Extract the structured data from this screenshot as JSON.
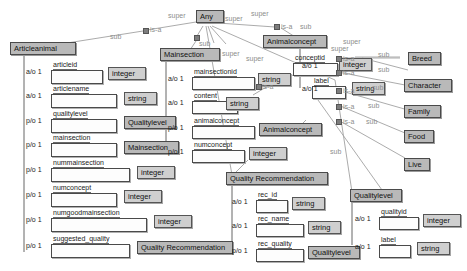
{
  "diagram": {
    "root": "Any",
    "edge_labels": {
      "super": "super",
      "sub": "sub",
      "isa": "is-a"
    },
    "colors": {
      "class_fill": "#b9b9b9",
      "type_fill": "#cfcfcf",
      "slot_fill": "#fdfdfd",
      "edge": "#9a9a9a",
      "text": "#111111",
      "edge_label": "#8d8d8d"
    }
  },
  "classes": {
    "any": {
      "label": "Any"
    },
    "articleanimal": {
      "label": "Articleanimal"
    },
    "mainsection": {
      "label": "Mainsection"
    },
    "animalconcept": {
      "label": "Animalconcept"
    },
    "quality_recommendation": {
      "label": "Quality Recommendation"
    },
    "qualitylevel": {
      "label": "Qualitylevel"
    },
    "breed": {
      "label": "Breed"
    },
    "character": {
      "label": "Character"
    },
    "family": {
      "label": "Family"
    },
    "food": {
      "label": "Food"
    },
    "live": {
      "label": "Live"
    }
  },
  "cardinalities": {
    "ao": "a/o 1",
    "po": "p/o 1"
  },
  "types": {
    "integer": "integer",
    "string": "string",
    "qualitylevel": "Qualitylevel",
    "mainsection": "Mainsection",
    "animalconcept": "Animalconcept",
    "quality_recommendation": "Quality Recommendation"
  },
  "articleanimal_attrs": [
    {
      "card": "a/o 1",
      "name": "articleid",
      "type": "integer"
    },
    {
      "card": "a/o 1",
      "name": "articlename",
      "type": "string"
    },
    {
      "card": "p/o 1",
      "name": "qualitylevel",
      "type": "Qualitylevel"
    },
    {
      "card": "p/o 1",
      "name": "mainsection",
      "type": "Mainsection"
    },
    {
      "card": "p/o 1",
      "name": "nummainsection",
      "type": "integer"
    },
    {
      "card": "p/o 1",
      "name": "numconcept",
      "type": "integer"
    },
    {
      "card": "p/o 1",
      "name": "numgoodmainsection",
      "type": "integer"
    },
    {
      "card": "p/o 1",
      "name": "suggested_quality",
      "type": "Quality Recommendation"
    }
  ],
  "mainsection_attrs": [
    {
      "card": "a/o 1",
      "name": "mainsectionid",
      "type": "string"
    },
    {
      "card": "a/o 1",
      "name": "content",
      "type": "string"
    },
    {
      "card": "p/o 1",
      "name": "animalconcept",
      "type": "Animalconcept"
    },
    {
      "card": "p/o 1",
      "name": "numconcept",
      "type": "integer"
    }
  ],
  "animalconcept_attrs": [
    {
      "card": "a/o 1",
      "name": "conceptid",
      "type": "integer"
    },
    {
      "card": "a/o 1",
      "name": "label",
      "type": "string"
    }
  ],
  "quality_recommendation_attrs": [
    {
      "card": "a/o 1",
      "name": "rec_id",
      "type": "string"
    },
    {
      "card": "a/o 1",
      "name": "rec_name",
      "type": "string"
    },
    {
      "card": "p/o 1",
      "name": "rec_quality",
      "type": "Qualitylevel"
    }
  ],
  "qualitylevel_attrs": [
    {
      "card": "a/o 1",
      "name": "qualityid",
      "type": "integer"
    },
    {
      "card": "a/o 1",
      "name": "label",
      "type": "string"
    }
  ],
  "subclasses_of_any": [
    "Articleanimal",
    "Mainsection",
    "Animalconcept",
    "Quality Recommendation",
    "Qualitylevel"
  ],
  "subclasses_of_animalconcept": [
    "Breed",
    "Character",
    "Family",
    "Food",
    "Live"
  ]
}
